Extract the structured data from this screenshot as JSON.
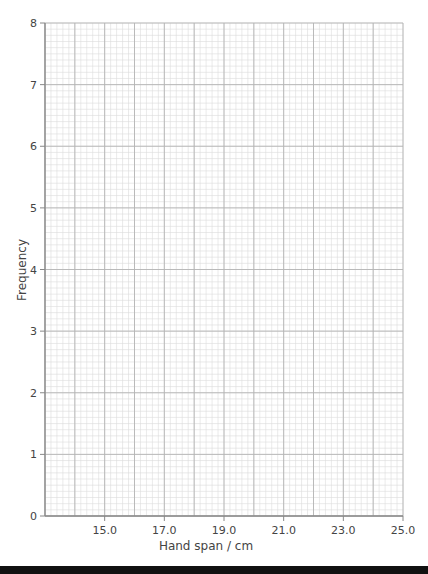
{
  "chart_data": {
    "type": "bar",
    "title": "",
    "xlabel": "Hand span / cm",
    "ylabel": "Frequency",
    "xlim": [
      13.0,
      25.0
    ],
    "ylim": [
      0,
      8
    ],
    "x_ticks": [
      "15.0",
      "17.0",
      "19.0",
      "21.0",
      "23.0",
      "25.0"
    ],
    "x_tick_values": [
      15,
      17,
      19,
      21,
      23,
      25
    ],
    "y_ticks": [
      "0",
      "1",
      "2",
      "3",
      "4",
      "5",
      "6",
      "7",
      "8"
    ],
    "y_tick_values": [
      0,
      1,
      2,
      3,
      4,
      5,
      6,
      7,
      8
    ],
    "grid": true,
    "grid_style": "graph paper: major lines every 1 unit, minor lines every 0.2 (x) and 0.1 (y)",
    "categories": [],
    "values": [],
    "legend": null
  },
  "colors": {
    "minor_grid": "#dcdcdc",
    "major_grid": "#b4b4b4",
    "axis": "#888888",
    "text": "#444444",
    "bottom_bar": "#111111"
  }
}
